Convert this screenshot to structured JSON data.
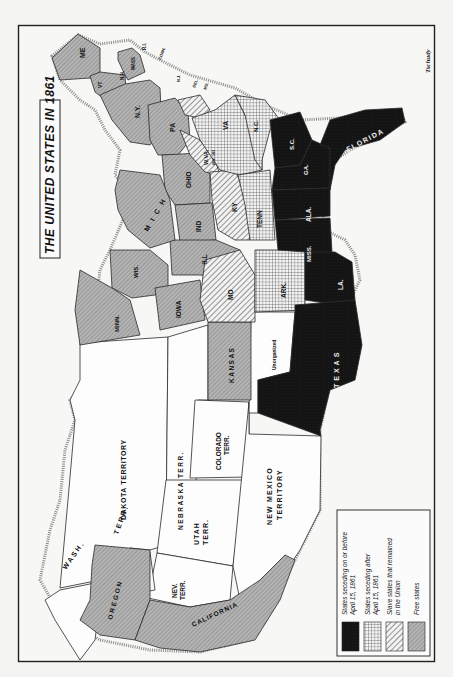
{
  "map": {
    "title": "THE UNITED STATES IN 1861",
    "signature": "Tschudy",
    "orientation": "rotated 90° clockwise (north points left)",
    "colors": {
      "paper": "#f4f4f2",
      "seceded_before": "#141414",
      "seceded_after": "#c9c9c9",
      "slave_union": "#e2e2e2",
      "free": "#a8a8a8",
      "territory": "#ffffff",
      "border": "#2a2a2a"
    },
    "legend": {
      "items": [
        {
          "key": "seceded_before",
          "line1": "States seceding on or before",
          "line2": "April 15, 1861",
          "pattern": "solid-black"
        },
        {
          "key": "seceded_after",
          "line1": "States seceding after",
          "line2": "April 15, 1861",
          "pattern": "crosshatch"
        },
        {
          "key": "slave_union",
          "line1": "Slave states that remained",
          "line2": "in the Union",
          "pattern": "diagonal-hatch"
        },
        {
          "key": "free",
          "line1": "Free states",
          "line2": "",
          "pattern": "fine-stipple-gray"
        }
      ]
    },
    "regions": {
      "free_states": [
        "ME",
        "VT",
        "N.H.",
        "MASS",
        "R.I.",
        "CONN.",
        "N.Y.",
        "N.J.",
        "PA",
        "OHIO",
        "IND",
        "ILL",
        "MICH",
        "WIS",
        "MINN",
        "IOWA",
        "KANSAS",
        "OREGON",
        "CALIFORNIA"
      ],
      "slave_states_union": [
        "DEL.",
        "MD.",
        "W.VA. (ADM. 1863)",
        "KY",
        "MO"
      ],
      "seceded_after": [
        "VA",
        "N.C.",
        "TENN",
        "ARK."
      ],
      "seceded_before": [
        "S.C.",
        "GA.",
        "FLORIDA",
        "ALA.",
        "MISS.",
        "LA.",
        "TEXAS"
      ],
      "territories": [
        "DAKOTA TERRITORY",
        "NEBRASKA TERR.",
        "COLORADO TERR.",
        "UTAH TERR.",
        "NEV. TERR.",
        "WASH. TERR.",
        "NEW MEXICO TERRITORY",
        "Unorganized"
      ]
    },
    "labels": {
      "me": "ME",
      "vt": "VT",
      "nh": "N.H.",
      "mass": "MASS",
      "ri": "R.I.",
      "conn": "CONN.",
      "ny": "N.Y.",
      "nj": "N.J.",
      "del": "DEL.",
      "md": "MD.",
      "pa": "PA",
      "va": "VA",
      "wva": "W.VA.",
      "wva_note": "ADM. 1863",
      "nc": "N.C.",
      "sc": "S.C.",
      "ga": "GA.",
      "florida": "FLORIDA",
      "ohio": "OHIO",
      "ky": "KY",
      "tenn": "TENN",
      "ala": "ALA.",
      "mich": "M I C H",
      "ind": "IND",
      "ill": "ILL",
      "miss": "MISS.",
      "wis": "WIS.",
      "iowa": "IOWA",
      "mo": "MO",
      "ark": "ARK.",
      "la": "LA.",
      "minn": "MINN.",
      "kansas": "KANSAS",
      "unorganized": "Unorganized",
      "texas": "TEXAS",
      "dakota": "DAKOTA TERRITORY",
      "nebraska": "NEBRASKA   TERR.",
      "colorado_1": "COLORADO",
      "colorado_2": "TERR.",
      "utah_1": "UTAH",
      "utah_2": "TERR.",
      "newmexico_1": "NEW MEXICO",
      "newmexico_2": "TERRITORY",
      "nev_1": "NEV.",
      "nev_2": "TERR.",
      "wash": "WASH.",
      "wash_terr": "TERR.",
      "oregon": "OREGON",
      "california": "CALIFORNIA"
    }
  }
}
